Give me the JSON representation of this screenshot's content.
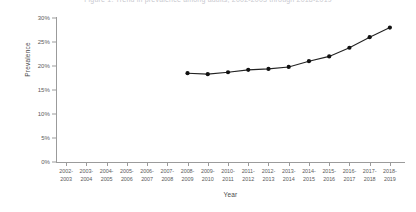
{
  "figure": {
    "clipped_top_text": "Figure 1. Trend in prevalence among adults, 2002-2003 through 2018-2019",
    "background": "#ffffff",
    "line_color": "#222222",
    "marker_color": "#111111",
    "axis_color": "#9b9b9b"
  },
  "chart_data": {
    "type": "line",
    "title": "",
    "xlabel": "Year",
    "ylabel": "Prevalence",
    "categories": [
      "2002-2003",
      "2003-2004",
      "2004-2005",
      "2005-2006",
      "2006-2007",
      "2007-2008",
      "2008-2009",
      "2009-2010",
      "2010-2011",
      "2011-2012",
      "2012-2013",
      "2013-2014",
      "2014-2015",
      "2015-2016",
      "2016-2017",
      "2017-2018",
      "2018-2019"
    ],
    "categories_line1": [
      "2002-",
      "2003-",
      "2004-",
      "2005-",
      "2006-",
      "2007-",
      "2008-",
      "2009-",
      "2010-",
      "2011-",
      "2012-",
      "2013-",
      "2014-",
      "2015-",
      "2016-",
      "2017-",
      "2018-"
    ],
    "categories_line2": [
      "2003",
      "2004",
      "2005",
      "2006",
      "2007",
      "2008",
      "2009",
      "2010",
      "2011",
      "2012",
      "2013",
      "2014",
      "2015",
      "2016",
      "2017",
      "2018",
      "2019"
    ],
    "series": [
      {
        "name": "Prevalence",
        "x": [
          "2008-2009",
          "2009-2010",
          "2010-2011",
          "2011-2012",
          "2012-2013",
          "2013-2014",
          "2014-2015",
          "2015-2016",
          "2016-2017",
          "2017-2018",
          "2018-2019"
        ],
        "x_index": [
          6,
          7,
          8,
          9,
          10,
          11,
          12,
          13,
          14,
          15,
          16
        ],
        "values": [
          18.5,
          18.3,
          18.7,
          19.2,
          19.4,
          19.8,
          21.0,
          22.0,
          23.8,
          26.0,
          28.0
        ]
      }
    ],
    "ylim": [
      0,
      30
    ],
    "yticks": [
      0,
      5,
      10,
      15,
      20,
      25,
      30
    ],
    "ytick_labels": [
      "0%",
      "5%",
      "10%",
      "15%",
      "20%",
      "25%",
      "30%"
    ],
    "grid": false,
    "legend": "none"
  }
}
